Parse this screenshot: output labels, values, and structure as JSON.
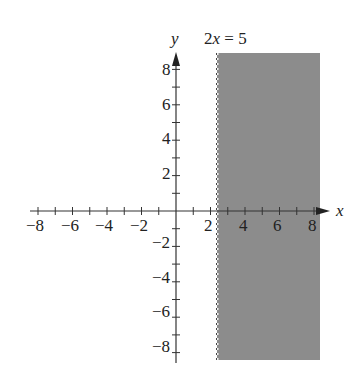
{
  "chart_data": {
    "type": "area",
    "title": "",
    "equation_label": "2x = 5",
    "xlabel": "x",
    "ylabel": "y",
    "xlim": [
      -8,
      8
    ],
    "ylim": [
      -8,
      8
    ],
    "grid": false,
    "x_ticks": [
      -8,
      -7,
      -6,
      -5,
      -4,
      -3,
      -2,
      -1,
      1,
      2,
      3,
      4,
      5,
      6,
      7,
      8
    ],
    "y_ticks": [
      -8,
      -7,
      -6,
      -5,
      -4,
      -3,
      -2,
      -1,
      1,
      2,
      3,
      4,
      5,
      6,
      7,
      8
    ],
    "x_tick_labels": [
      "-8",
      "-6",
      "-4",
      "-2",
      "2",
      "4",
      "6",
      "8"
    ],
    "y_tick_labels": [
      "8",
      "6",
      "4",
      "2",
      "-2",
      "-4",
      "-6",
      "-8"
    ],
    "boundary": {
      "x": 2.5,
      "style": "dashed",
      "equation": "2x = 5"
    },
    "shaded_region": {
      "inequality": "2x > 5",
      "x_from": 2.5,
      "x_to": 8.3,
      "y_from": -8.5,
      "y_to": 9,
      "color": "#8c8c8c"
    }
  },
  "labels": {
    "x_axis": "x",
    "y_axis": "y",
    "equation": "2x = 5",
    "xticks": [
      "−8",
      "−6",
      "−4",
      "−2",
      "2",
      "4",
      "6",
      "8"
    ],
    "yticks": [
      "8",
      "6",
      "4",
      "2",
      "−2",
      "−4",
      "−6",
      "−8"
    ]
  },
  "colors": {
    "shade": "#8c8c8c",
    "axis": "#333333",
    "text": "#222222"
  }
}
